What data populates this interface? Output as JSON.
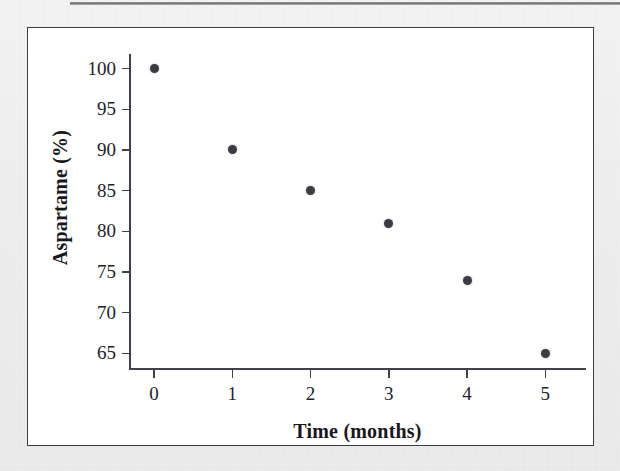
{
  "figure": {
    "background_color": "#f2f2f2",
    "plot_background_color": "#ffffff",
    "frame_color": "#3c3c46",
    "axis_color": "#41414a",
    "marker_color": "#3b3b42"
  },
  "chart_data": {
    "type": "scatter",
    "title": "",
    "xlabel": "Time (months)",
    "ylabel": "Aspartame (%)",
    "x": [
      0,
      1,
      2,
      3,
      4,
      5
    ],
    "values": [
      100,
      90,
      85,
      81,
      74,
      65
    ],
    "series": [
      {
        "name": "Aspartame",
        "points": [
          {
            "x": 0,
            "y": 100
          },
          {
            "x": 1,
            "y": 90
          },
          {
            "x": 2,
            "y": 85
          },
          {
            "x": 3,
            "y": 81
          },
          {
            "x": 4,
            "y": 74
          },
          {
            "x": 5,
            "y": 65
          }
        ]
      }
    ],
    "xlim": [
      -0.32,
      5.52
    ],
    "ylim": [
      63.2,
      101.8
    ],
    "xticks": [
      0,
      1,
      2,
      3,
      4,
      5
    ],
    "xtick_labels": [
      "0",
      "1",
      "2",
      "3",
      "4",
      "5"
    ],
    "yticks": [
      65,
      70,
      75,
      80,
      85,
      90,
      95,
      100
    ],
    "ytick_labels": [
      "65",
      "70",
      "75",
      "80",
      "85",
      "90",
      "95",
      "100"
    ],
    "grid": false,
    "legend": null,
    "marker": "filled-circle"
  }
}
